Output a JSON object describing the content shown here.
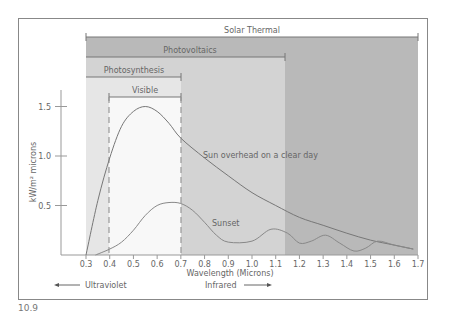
{
  "figure_number": "10.9",
  "chart_data": {
    "type": "line",
    "title": "",
    "xlabel": "Wavelength (Microns)",
    "ylabel": "kW/m² microns",
    "xlim": [
      0.3,
      1.7
    ],
    "ylim": [
      0,
      1.6
    ],
    "grid": false,
    "x_ticks": [
      "0.3",
      "0.4",
      "0.5",
      "0.6",
      "0.7",
      "0.8",
      "0.9",
      "1.0",
      "1.1",
      "1.2",
      "1.3",
      "1.4",
      "1.5",
      "1.6",
      "1.7"
    ],
    "y_ticks": [
      "0.5",
      "1.0",
      "1.5"
    ],
    "series": [
      {
        "name": "Sun overhead on a clear day",
        "x": [
          0.3,
          0.35,
          0.4,
          0.45,
          0.5,
          0.55,
          0.6,
          0.65,
          0.7,
          0.8,
          0.9,
          1.0,
          1.1,
          1.2,
          1.3,
          1.4,
          1.5,
          1.6,
          1.68
        ],
        "y": [
          0.0,
          0.55,
          0.98,
          1.3,
          1.45,
          1.5,
          1.45,
          1.33,
          1.18,
          0.98,
          0.8,
          0.63,
          0.5,
          0.38,
          0.3,
          0.22,
          0.15,
          0.1,
          0.06
        ]
      },
      {
        "name": "Sunset",
        "x": [
          0.34,
          0.4,
          0.45,
          0.5,
          0.55,
          0.6,
          0.65,
          0.7,
          0.75,
          0.8,
          0.85,
          0.9,
          1.0,
          1.08,
          1.15,
          1.2,
          1.25,
          1.31,
          1.37,
          1.43,
          1.48,
          1.53,
          1.6,
          1.68
        ],
        "y": [
          0.0,
          0.06,
          0.13,
          0.25,
          0.4,
          0.5,
          0.53,
          0.52,
          0.45,
          0.33,
          0.2,
          0.13,
          0.14,
          0.26,
          0.22,
          0.12,
          0.14,
          0.2,
          0.12,
          0.04,
          0.07,
          0.14,
          0.1,
          0.06
        ]
      }
    ],
    "regions": [
      {
        "name": "Solar Thermal",
        "x_start": 0.3,
        "x_end": 1.7,
        "color": "#b4b4b4"
      },
      {
        "name": "Photovoltaics",
        "x_start": 0.3,
        "x_end": 1.2,
        "color": "#d2d2d2"
      },
      {
        "name": "Photosynthesis",
        "x_start": 0.3,
        "x_end": 0.7,
        "color": "#e4e4e4"
      },
      {
        "name": "Visible",
        "x_start": 0.4,
        "x_end": 0.7,
        "color": "#f7f7f7"
      }
    ],
    "annotations": [
      {
        "text": "Sun overhead on a clear day",
        "x": 0.86,
        "y": 1.0
      },
      {
        "text": "Sunset",
        "x": 0.9,
        "y": 0.33
      },
      {
        "text": "Ultraviolet",
        "direction": "left"
      },
      {
        "text": "Infrared",
        "direction": "right"
      }
    ]
  },
  "labels": {
    "solar_thermal": "Solar Thermal",
    "photovoltaics": "Photovoltaics",
    "photosynthesis": "Photosynthesis",
    "visible": "Visible",
    "curve_clear": "Sun overhead on a clear day",
    "curve_sunset": "Sunset",
    "xlabel": "Wavelength (Microns)",
    "ylabel": "kW/m² microns",
    "ultraviolet": "Ultraviolet",
    "infrared": "Infrared"
  }
}
